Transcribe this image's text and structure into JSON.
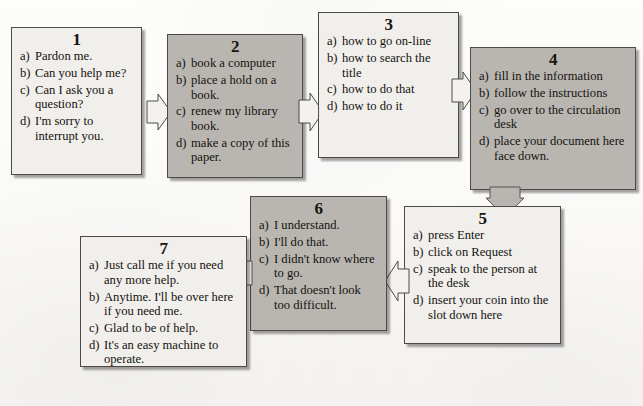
{
  "diagram": {
    "background_color": "#fdfdfc",
    "shaded_fill": "#b9b6b1",
    "light_fill": "#f1efec",
    "boxes": [
      {
        "number": "1",
        "shade": "light",
        "options": [
          {
            "label": "a)",
            "text": "Pardon me."
          },
          {
            "label": "b)",
            "text": "Can you help me?"
          },
          {
            "label": "c)",
            "text": "Can I ask you a question?"
          },
          {
            "label": "d)",
            "text": "I'm sorry to interrupt you."
          }
        ]
      },
      {
        "number": "2",
        "shade": "shaded",
        "options": [
          {
            "label": "a)",
            "text": "book a computer"
          },
          {
            "label": "b)",
            "text": "place a hold on a book."
          },
          {
            "label": "c)",
            "text": "renew my library book."
          },
          {
            "label": "d)",
            "text": "make a copy of this paper."
          }
        ]
      },
      {
        "number": "3",
        "shade": "light",
        "options": [
          {
            "label": "a)",
            "text": "how to go on-line"
          },
          {
            "label": "b)",
            "text": "how to search the title"
          },
          {
            "label": "c)",
            "text": "how to do that"
          },
          {
            "label": "d)",
            "text": "how to do it"
          }
        ]
      },
      {
        "number": "4",
        "shade": "shaded",
        "options": [
          {
            "label": "a)",
            "text": "fill in the information"
          },
          {
            "label": "b)",
            "text": "follow the instructions"
          },
          {
            "label": "c)",
            "text": "go over to the circulation desk"
          },
          {
            "label": "d)",
            "text": "place your document here face down."
          }
        ]
      },
      {
        "number": "5",
        "shade": "light",
        "options": [
          {
            "label": "a)",
            "text": "press Enter"
          },
          {
            "label": "b)",
            "text": "click on Request"
          },
          {
            "label": "c)",
            "text": "speak to the person at the desk"
          },
          {
            "label": "d)",
            "text": "insert your coin into the slot down here"
          }
        ]
      },
      {
        "number": "6",
        "shade": "shaded",
        "options": [
          {
            "label": "a)",
            "text": "I understand."
          },
          {
            "label": "b)",
            "text": "I'll do that."
          },
          {
            "label": "c)",
            "text": "I didn't know where to go."
          },
          {
            "label": "d)",
            "text": "That doesn't look too difficult."
          }
        ]
      },
      {
        "number": "7",
        "shade": "light",
        "options": [
          {
            "label": "a)",
            "text": "Just call me if you need any more help."
          },
          {
            "label": "b)",
            "text": "Anytime. I'll be over here if you need me."
          },
          {
            "label": "c)",
            "text": "Glad to be of help."
          },
          {
            "label": "d)",
            "text": "It's an easy machine to operate."
          }
        ]
      }
    ],
    "connectors": [
      {
        "from": "1",
        "to": "2",
        "direction": "right",
        "style": "outline"
      },
      {
        "from": "2",
        "to": "3",
        "direction": "right",
        "style": "outline"
      },
      {
        "from": "3",
        "to": "4",
        "direction": "right",
        "style": "outline"
      },
      {
        "from": "4",
        "to": "5",
        "direction": "down",
        "style": "shaded"
      },
      {
        "from": "5",
        "to": "6",
        "direction": "left",
        "style": "outline"
      },
      {
        "from": "6",
        "to": "7",
        "direction": "left",
        "style": "outline"
      }
    ]
  }
}
